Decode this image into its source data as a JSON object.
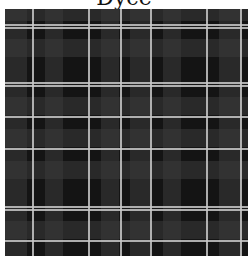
{
  "title": "Dyce",
  "tartan": {
    "name": "Dyce",
    "base_color": "#141414",
    "gray_band_color": "#3a3a3a",
    "stripe_color": "#c8c8c8",
    "vertical_gray_bands": [
      {
        "x": 0,
        "w": 22
      },
      {
        "x": 40,
        "w": 18
      },
      {
        "x": 96,
        "w": 18
      },
      {
        "x": 125,
        "w": 20
      },
      {
        "x": 158,
        "w": 18
      },
      {
        "x": 214,
        "w": 22
      }
    ],
    "horizontal_gray_bands": [
      {
        "y": 0,
        "w": 12
      },
      {
        "y": 30,
        "w": 18
      },
      {
        "y": 88,
        "w": 18
      },
      {
        "y": 120,
        "w": 18
      },
      {
        "y": 152,
        "w": 18
      },
      {
        "y": 212,
        "w": 18
      }
    ],
    "vertical_stripes": [
      27,
      83,
      115,
      145,
      201,
      235
    ],
    "horizontal_stripes": [
      15,
      18,
      73,
      76,
      107,
      139,
      197,
      200,
      231
    ]
  }
}
